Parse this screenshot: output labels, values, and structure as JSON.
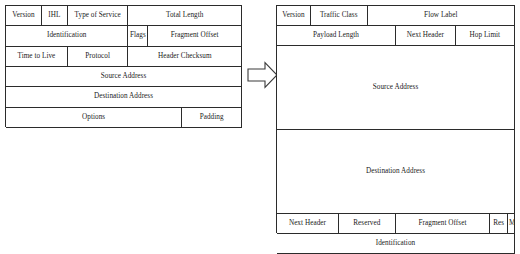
{
  "figure": {
    "arrow_label": "transforms-to",
    "line_color": "#2b2b2b",
    "background_color": "#ffffff"
  },
  "ipv4_header": {
    "name": "IPv4 Header",
    "rows": [
      {
        "cells": [
          {
            "label": "Version",
            "width_pct": 15.2
          },
          {
            "label": "IHL",
            "width_pct": 11.0
          },
          {
            "label": "Type of Service",
            "width_pct": 25.7
          },
          {
            "label": "Total Length",
            "width_pct": 48.1
          }
        ]
      },
      {
        "cells": [
          {
            "label": "Identification",
            "width_pct": 51.9
          },
          {
            "label": "Flags",
            "width_pct": 8.4
          },
          {
            "label": "Fragment Offset",
            "width_pct": 39.7
          }
        ]
      },
      {
        "cells": [
          {
            "label": "Time to Live",
            "width_pct": 26.2
          },
          {
            "label": "Protocol",
            "width_pct": 25.7
          },
          {
            "label": "Header Checksum",
            "width_pct": 48.1
          }
        ]
      },
      {
        "cells": [
          {
            "label": "Source Address",
            "width_pct": 100
          }
        ]
      },
      {
        "cells": [
          {
            "label": "Destination Address",
            "width_pct": 100
          }
        ]
      },
      {
        "cells": [
          {
            "label": "Options",
            "width_pct": 74.7
          },
          {
            "label": "Padding",
            "width_pct": 25.3
          }
        ]
      }
    ]
  },
  "ipv6_header": {
    "name": "IPv6 Header",
    "rows": [
      {
        "cells": [
          {
            "label": "Version",
            "width_pct": 14.2
          },
          {
            "label": "Traffic Class",
            "width_pct": 23.9
          },
          {
            "label": "Flow Label",
            "width_pct": 61.9
          }
        ]
      },
      {
        "cells": [
          {
            "label": "Payload Length",
            "width_pct": 50.0
          },
          {
            "label": "Next Header",
            "width_pct": 25.1
          },
          {
            "label": "Hop Limit",
            "width_pct": 24.9
          }
        ]
      },
      {
        "cells": [
          {
            "label": "Source Address",
            "width_pct": 100
          }
        ]
      },
      {
        "cells": [
          {
            "label": "Destination Address",
            "width_pct": 100
          }
        ]
      },
      {
        "cells": [
          {
            "label": "Next Header",
            "width_pct": 26.0
          },
          {
            "label": "Reserved",
            "width_pct": 23.9
          },
          {
            "label": "Fragment Offset",
            "width_pct": 39.7
          },
          {
            "label": "Res",
            "width_pct": 7.5
          },
          {
            "label": "M",
            "width_pct": 2.9
          }
        ]
      },
      {
        "cells": [
          {
            "label": "Identification",
            "width_pct": 100
          }
        ]
      }
    ]
  }
}
